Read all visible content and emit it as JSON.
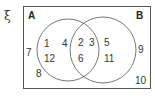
{
  "diagram": {
    "type": "venn",
    "universal_symbol": "ξ",
    "sets": [
      {
        "name": "A",
        "label": "A"
      },
      {
        "name": "B",
        "label": "B"
      }
    ],
    "regions": {
      "A_only": [
        "1",
        "4",
        "12"
      ],
      "A_and_B": [
        "2",
        "3",
        "6"
      ],
      "B_only": [
        "5",
        "11"
      ],
      "outside": [
        "7",
        "8",
        "9",
        "10"
      ]
    },
    "colors": {
      "stroke": "#555555",
      "text": "#333333"
    }
  }
}
